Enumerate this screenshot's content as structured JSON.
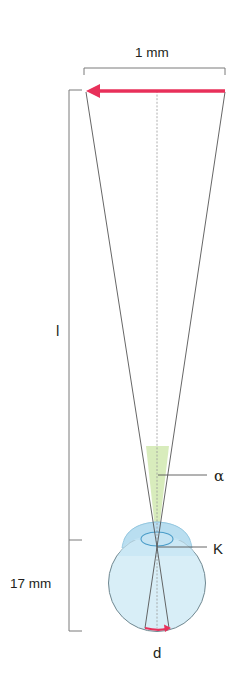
{
  "diagram": {
    "labels": {
      "object_width": "1 mm",
      "viewing_distance": "l",
      "visual_angle": "α",
      "nodal_point": "K",
      "eye_length": "17 mm",
      "retinal_image": "d"
    },
    "colors": {
      "arrow": "#e8305a",
      "angle_fill": "#d6ebb8",
      "eye_fill": "#d8eef7",
      "eye_stroke": "#6f8790",
      "cornea_fill": "#b9def0",
      "lens_stroke": "#4a9cc8",
      "line": "#555555",
      "bracket": "#7a7a7a"
    }
  }
}
